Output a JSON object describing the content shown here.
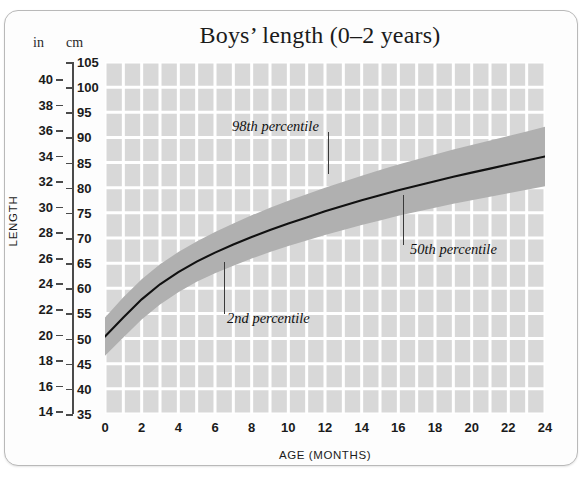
{
  "card": {
    "name": "growth-chart-card"
  },
  "chart_data": {
    "type": "line",
    "title": "Boys’ length (0–2 years)",
    "xlabel": "AGE (MONTHS)",
    "ylabel": "LENGTH",
    "y_unit_primary": "cm",
    "y_unit_secondary": "in",
    "unit_caption_in": "in",
    "unit_caption_cm": "cm",
    "xlim": [
      0,
      24
    ],
    "ylim_cm": [
      35,
      105
    ],
    "ylim_in": [
      14,
      40
    ],
    "grid": true,
    "grid_color": "#ffffff",
    "plot_background": "#d8d8d8",
    "band_color": "#b0b0b0",
    "curve_color": "#111111",
    "legend_position": "none",
    "x_ticks": [
      0,
      2,
      4,
      6,
      8,
      10,
      12,
      14,
      16,
      18,
      20,
      22,
      24
    ],
    "x_minor_step": 1,
    "y_ticks_cm": [
      35,
      40,
      45,
      50,
      55,
      60,
      65,
      70,
      75,
      80,
      85,
      90,
      95,
      100,
      105
    ],
    "y_ticks_in": [
      14,
      16,
      18,
      20,
      22,
      24,
      26,
      28,
      30,
      32,
      34,
      36,
      38,
      40
    ],
    "x": [
      0,
      1,
      2,
      3,
      4,
      5,
      6,
      7,
      8,
      9,
      10,
      11,
      12,
      13,
      14,
      15,
      16,
      17,
      18,
      19,
      20,
      21,
      22,
      23,
      24
    ],
    "series": [
      {
        "name": "50th percentile",
        "role": "median",
        "values": [
          50.4,
          54.2,
          57.8,
          60.8,
          63.2,
          65.3,
          67.1,
          68.7,
          70.2,
          71.6,
          72.9,
          74.1,
          75.3,
          76.4,
          77.5,
          78.5,
          79.5,
          80.4,
          81.3,
          82.2,
          83.0,
          83.8,
          84.6,
          85.4,
          86.2
        ]
      },
      {
        "name": "98th percentile",
        "role": "band-upper",
        "values": [
          54.2,
          58.2,
          61.8,
          64.8,
          67.2,
          69.3,
          71.2,
          72.9,
          74.5,
          76.0,
          77.4,
          78.7,
          80.0,
          81.2,
          82.4,
          83.5,
          84.6,
          85.6,
          86.6,
          87.6,
          88.5,
          89.4,
          90.3,
          91.2,
          92.1
        ]
      },
      {
        "name": "2nd percentile",
        "role": "band-lower",
        "values": [
          46.6,
          50.2,
          53.8,
          56.8,
          59.2,
          61.3,
          63.0,
          64.5,
          65.9,
          67.2,
          68.4,
          69.5,
          70.6,
          71.6,
          72.6,
          73.5,
          74.4,
          75.2,
          76.0,
          76.8,
          77.5,
          78.2,
          78.9,
          79.6,
          80.3
        ]
      }
    ],
    "annotations": [
      {
        "label": "98th percentile",
        "target_months": 13.9,
        "target_cm": 88.5
      },
      {
        "label": "2nd percentile",
        "target_months": 6.6,
        "target_cm": 63.0
      },
      {
        "label": "50th percentile",
        "target_months": 16.4,
        "target_cm": 80.2
      }
    ]
  }
}
